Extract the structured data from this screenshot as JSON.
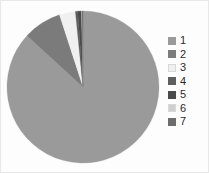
{
  "chart_data": {
    "type": "pie",
    "title": "",
    "subtitle": "",
    "xlabel": "",
    "ylabel": "",
    "grid": false,
    "legend_position": "right",
    "start_angle_deg": 0,
    "direction": "clockwise",
    "categories": [
      "1",
      "2",
      "3",
      "4",
      "5",
      "6",
      "7"
    ],
    "values": [
      86.8,
      8.2,
      3.4,
      0.5,
      0.8,
      0.1,
      0.2
    ],
    "labels": [
      "1",
      "2",
      "3",
      "4",
      "5",
      "6",
      "7"
    ],
    "colors": [
      "#9a9a9a",
      "#7b7b7b",
      "#f0f0f0",
      "#5e5e5e",
      "#4a4a4a",
      "#cfcfcf",
      "#6d6d6d"
    ],
    "series": [
      {
        "name": "Series 1",
        "values": [
          86.8,
          8.2,
          3.4,
          0.5,
          0.8,
          0.1,
          0.2
        ]
      }
    ]
  },
  "chart": {
    "center_x": 83,
    "center_y": 87,
    "radius": 76,
    "background_color": "#fdfdfd",
    "border_color": "#e8e8e8"
  },
  "legend": {
    "items": [
      {
        "label": "1",
        "color": "#9a9a9a"
      },
      {
        "label": "2",
        "color": "#7b7b7b"
      },
      {
        "label": "3",
        "color": "#f0f0f0"
      },
      {
        "label": "4",
        "color": "#5e5e5e"
      },
      {
        "label": "5",
        "color": "#4a4a4a"
      },
      {
        "label": "6",
        "color": "#cfcfcf"
      },
      {
        "label": "7",
        "color": "#6d6d6d"
      }
    ]
  }
}
